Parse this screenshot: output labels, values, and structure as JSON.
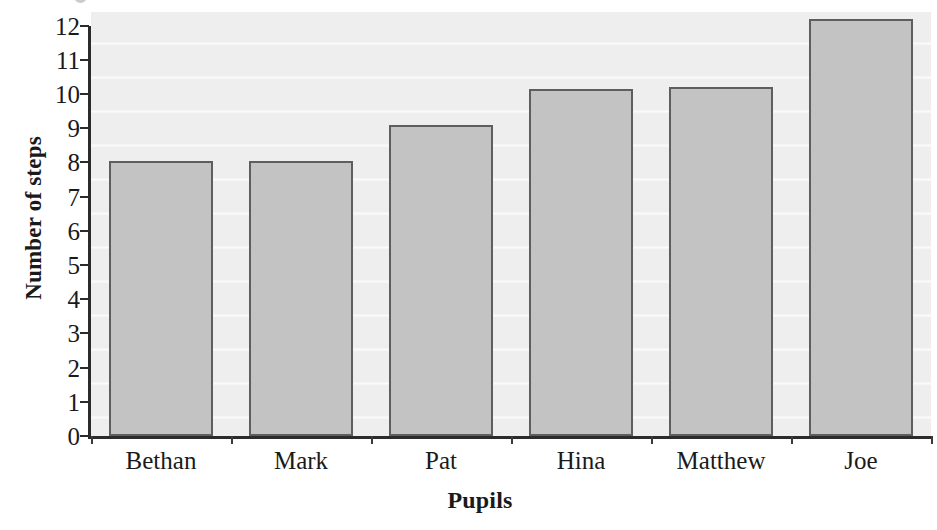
{
  "chart_data": {
    "type": "bar",
    "title": "",
    "subtitle": "",
    "xlabel": "Pupils",
    "ylabel": "Number of steps",
    "categories": [
      "Bethan",
      "Mark",
      "Pat",
      "Hina",
      "Matthew",
      "Joe"
    ],
    "values": [
      8.05,
      8.05,
      9.1,
      10.15,
      10.2,
      12.2
    ],
    "series": [
      {
        "name": "Number of steps",
        "values": [
          8.05,
          8.05,
          9.1,
          10.15,
          10.2,
          12.2
        ]
      }
    ],
    "ylim": [
      0,
      12.5
    ],
    "ytick_labels": [
      "0",
      "1",
      "2",
      "3",
      "4",
      "5",
      "6",
      "7",
      "8",
      "9",
      "10",
      "11",
      "12"
    ],
    "ytick_values": [
      0,
      1,
      2,
      3,
      4,
      5,
      6,
      7,
      8,
      9,
      10,
      11,
      12
    ],
    "grid": true,
    "grid_orientation": "horizontal",
    "legend": false,
    "legend_position": "none",
    "annotations": [],
    "colors": {
      "bar_fill": "#c3c3c3",
      "bar_edge": "#5e5e5e",
      "plot_background": "#eeeeee",
      "gridline": "#ffffff",
      "axis": "#2b2b2b",
      "text": "#1a1a1a",
      "page_background": "#ffffff"
    }
  },
  "axes": {
    "y_title": "Number of steps",
    "x_title": "Pupils"
  }
}
